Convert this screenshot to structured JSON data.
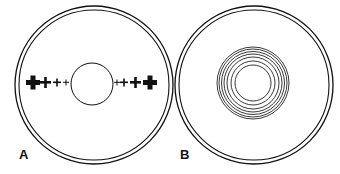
{
  "panels": [
    {
      "label": "A",
      "description": "double outer circle with central circle and graded plus signs on both sides"
    },
    {
      "label": "B",
      "description": "double outer circle with concentric rings at center"
    }
  ],
  "colors": {
    "stroke": "#111111",
    "background": "#ffffff"
  }
}
